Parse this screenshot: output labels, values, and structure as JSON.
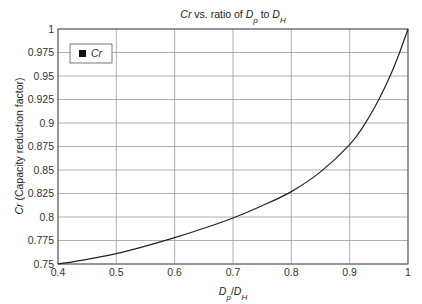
{
  "chart_data": {
    "type": "line",
    "title": {
      "parts": [
        {
          "text": "Cr",
          "italic": true,
          "sub": false
        },
        {
          "text": " vs. ratio of ",
          "italic": false,
          "sub": false
        },
        {
          "text": "D",
          "italic": true,
          "sub": false
        },
        {
          "text": "p",
          "italic": true,
          "sub": true
        },
        {
          "text": " to ",
          "italic": false,
          "sub": false
        },
        {
          "text": "D",
          "italic": true,
          "sub": false
        },
        {
          "text": "H",
          "italic": true,
          "sub": true
        }
      ]
    },
    "xlabel": {
      "parts": [
        {
          "text": "D",
          "italic": true,
          "sub": false
        },
        {
          "text": "p",
          "italic": true,
          "sub": true
        },
        {
          "text": "/",
          "italic": false,
          "sub": false
        },
        {
          "text": "D",
          "italic": true,
          "sub": false
        },
        {
          "text": "H",
          "italic": true,
          "sub": true
        }
      ]
    },
    "ylabel": {
      "parts": [
        {
          "text": "Cr",
          "italic": true,
          "sub": false
        },
        {
          "text": " (Capacity reduction factor)",
          "italic": false,
          "sub": false
        }
      ]
    },
    "xlim": [
      0.4,
      1.0
    ],
    "ylim": [
      0.75,
      1.0
    ],
    "xticks": [
      0.4,
      0.5,
      0.6,
      0.7,
      0.8,
      0.9,
      1
    ],
    "xtick_labels": [
      "0.4",
      "0.5",
      "0.6",
      "0.7",
      "0.8",
      "0.9",
      "1"
    ],
    "yticks": [
      0.75,
      0.775,
      0.8,
      0.825,
      0.85,
      0.875,
      0.9,
      0.925,
      0.95,
      0.975,
      1
    ],
    "ytick_labels": [
      "0.75",
      "0.775",
      "0.8",
      "0.825",
      "0.85",
      "0.875",
      "0.9",
      "0.925",
      "0.95",
      "0.975",
      "1"
    ],
    "grid": true,
    "legend": {
      "placement": "top-left",
      "entries": [
        {
          "label": "Cr",
          "marker": "square",
          "color": "#111111"
        }
      ]
    },
    "series": [
      {
        "name": "Cr",
        "color": "#222222",
        "x": [
          0.4,
          0.45,
          0.5,
          0.55,
          0.6,
          0.65,
          0.7,
          0.75,
          0.8,
          0.85,
          0.9,
          0.925,
          0.95,
          0.97,
          0.985,
          1.0
        ],
        "y": [
          0.75,
          0.755,
          0.761,
          0.769,
          0.778,
          0.788,
          0.799,
          0.812,
          0.827,
          0.848,
          0.877,
          0.898,
          0.925,
          0.951,
          0.974,
          1.0
        ]
      }
    ]
  }
}
